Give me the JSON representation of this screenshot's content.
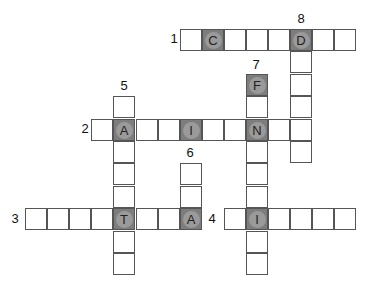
{
  "puzzle": {
    "grid": {
      "origin_x": 25,
      "origin_y": 29,
      "pitch_x": 22.1,
      "pitch_y": 22.4
    },
    "entries": [
      {
        "number": "1",
        "direction": "across",
        "row": 0,
        "col": 7,
        "length": 8,
        "label_pos": [
          167,
          32
        ]
      },
      {
        "number": "2",
        "direction": "across",
        "row": 4,
        "col": 3,
        "length": 10,
        "label_pos": [
          78,
          122
        ]
      },
      {
        "number": "3",
        "direction": "across",
        "row": 8,
        "col": 0,
        "length": 8,
        "label_pos": [
          8,
          212
        ]
      },
      {
        "number": "4",
        "direction": "across",
        "row": 8,
        "col": 9,
        "length": 6,
        "label_pos": [
          205,
          212
        ]
      },
      {
        "number": "5",
        "direction": "down",
        "row": 3,
        "col": 4,
        "length": 8,
        "label_pos": [
          117,
          79
        ]
      },
      {
        "number": "6",
        "direction": "down",
        "row": 6,
        "col": 7,
        "length": 3,
        "label_pos": [
          183,
          146
        ]
      },
      {
        "number": "7",
        "direction": "down",
        "row": 2,
        "col": 10,
        "length": 9,
        "label_pos": [
          249,
          58
        ]
      },
      {
        "number": "8",
        "direction": "down",
        "row": 0,
        "col": 12,
        "length": 6,
        "label_pos": [
          294,
          12
        ]
      }
    ],
    "given_letters": [
      {
        "row": 0,
        "col": 8,
        "letter": "C"
      },
      {
        "row": 0,
        "col": 12,
        "letter": "D"
      },
      {
        "row": 2,
        "col": 10,
        "letter": "F"
      },
      {
        "row": 4,
        "col": 4,
        "letter": "A"
      },
      {
        "row": 4,
        "col": 7,
        "letter": "I"
      },
      {
        "row": 4,
        "col": 10,
        "letter": "N"
      },
      {
        "row": 8,
        "col": 4,
        "letter": "T"
      },
      {
        "row": 8,
        "col": 7,
        "letter": "A"
      },
      {
        "row": 8,
        "col": 10,
        "letter": "I"
      }
    ],
    "colors": {
      "shaded": "#7d7d7d",
      "circle": "#9a9a9a",
      "border": "#555555"
    }
  }
}
